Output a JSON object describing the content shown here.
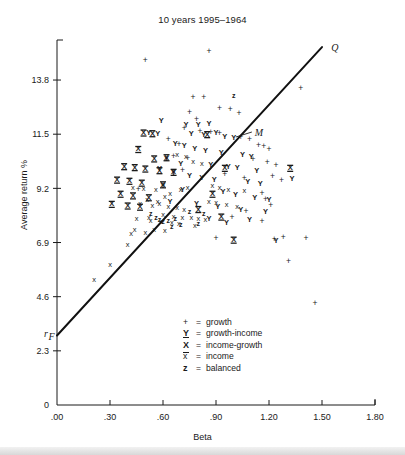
{
  "chart_data": {
    "type": "scatter",
    "title": "10 years 1995–1964",
    "xlabel": "Beta",
    "ylabel": "Average return %",
    "xlim": [
      0.0,
      1.8
    ],
    "ylim": [
      0.0,
      15.5
    ],
    "xticks": [
      0.0,
      0.3,
      0.6,
      0.9,
      1.2,
      1.5,
      1.8
    ],
    "xticklabels": [
      ".00",
      ".30",
      ".60",
      ".90",
      "1.20",
      "1.50",
      "1.80"
    ],
    "yticks": [
      0.0,
      2.3,
      4.6,
      6.9,
      9.2,
      11.5,
      13.8
    ],
    "yticklabels": [
      "0",
      "2.3",
      "4.6",
      "6.9",
      "9.2",
      "11.5",
      "13.8"
    ],
    "grid": false,
    "legend_position": "inside-lower-center",
    "legend": [
      {
        "symbol": "+",
        "label": "growth",
        "key": "growth"
      },
      {
        "symbol": "Y",
        "label": "growth-income",
        "key": "growth-income"
      },
      {
        "symbol": "⫨",
        "label": "income-growth",
        "key": "income-growth"
      },
      {
        "symbol": "x",
        "label": "income",
        "key": "income"
      },
      {
        "symbol": "z",
        "label": "balanced",
        "key": "balanced"
      }
    ],
    "annotations": [
      {
        "text": "Q",
        "x": 1.53,
        "y": 15.15,
        "note": "upper end label of the market line"
      },
      {
        "text": "M",
        "x": 1.12,
        "y": 11.55,
        "note": "market portfolio, leader line to point on line"
      },
      {
        "text": "rF",
        "display": "rₙ",
        "x": -0.055,
        "y": 3.02,
        "note": "risk-free rate intercept on y-axis"
      }
    ],
    "line": {
      "name": "market line",
      "label_start": "r_F",
      "label_end": "Q",
      "x0": 0.0,
      "y0": 2.95,
      "x1": 1.5,
      "y1": 15.2,
      "color": "#111111",
      "width": 2
    },
    "series": [
      {
        "name": "growth",
        "symbol": "+",
        "points": [
          [
            0.5,
            14.6
          ],
          [
            0.86,
            14.98
          ],
          [
            0.77,
            13.05
          ],
          [
            0.83,
            13.05
          ],
          [
            0.92,
            12.6
          ],
          [
            0.98,
            12.55
          ],
          [
            1.03,
            12.35
          ],
          [
            0.75,
            12.4
          ],
          [
            0.79,
            12.1
          ],
          [
            0.72,
            11.75
          ],
          [
            0.81,
            11.62
          ],
          [
            0.87,
            11.55
          ],
          [
            0.92,
            11.5
          ],
          [
            1.04,
            11.35
          ],
          [
            1.09,
            11.25
          ],
          [
            0.63,
            11.28
          ],
          [
            0.69,
            11.05
          ],
          [
            1.14,
            11.0
          ],
          [
            1.17,
            10.95
          ],
          [
            1.2,
            10.85
          ],
          [
            1.38,
            13.45
          ],
          [
            0.66,
            10.55
          ],
          [
            0.74,
            10.45
          ],
          [
            1.11,
            10.42
          ],
          [
            1.19,
            10.28
          ],
          [
            1.24,
            10.15
          ],
          [
            0.71,
            9.95
          ],
          [
            0.95,
            9.78
          ],
          [
            1.06,
            9.6
          ],
          [
            1.22,
            9.7
          ],
          [
            1.27,
            9.52
          ],
          [
            0.46,
            9.15
          ],
          [
            1.16,
            8.95
          ],
          [
            1.18,
            8.72
          ],
          [
            1.21,
            8.48
          ],
          [
            1.07,
            8.2
          ],
          [
            0.99,
            7.95
          ],
          [
            1.16,
            7.8
          ],
          [
            0.9,
            7.05
          ],
          [
            1.23,
            7.0
          ],
          [
            1.28,
            7.12
          ],
          [
            1.41,
            7.05
          ],
          [
            1.46,
            4.3
          ],
          [
            1.31,
            6.1
          ]
        ]
      },
      {
        "name": "growth-income",
        "symbol": "Y",
        "points": [
          [
            0.59,
            12.05
          ],
          [
            0.52,
            11.55
          ],
          [
            0.57,
            11.52
          ],
          [
            0.73,
            11.9
          ],
          [
            0.8,
            11.88
          ],
          [
            0.86,
            11.95
          ],
          [
            0.76,
            11.52
          ],
          [
            0.83,
            11.45
          ],
          [
            0.9,
            11.55
          ],
          [
            0.95,
            11.4
          ],
          [
            1.0,
            11.35
          ],
          [
            0.67,
            11.1
          ],
          [
            0.72,
            10.98
          ],
          [
            0.78,
            10.85
          ],
          [
            0.84,
            10.8
          ],
          [
            0.93,
            10.72
          ],
          [
            1.05,
            10.62
          ],
          [
            1.1,
            10.55
          ],
          [
            0.62,
            10.45
          ],
          [
            0.7,
            10.25
          ],
          [
            0.87,
            10.2
          ],
          [
            0.97,
            10.12
          ],
          [
            1.02,
            10.05
          ],
          [
            1.13,
            9.95
          ],
          [
            0.58,
            10.02
          ],
          [
            0.66,
            9.85
          ],
          [
            0.75,
            9.72
          ],
          [
            0.82,
            9.65
          ],
          [
            0.89,
            9.55
          ],
          [
            1.08,
            9.45
          ],
          [
            1.15,
            9.4
          ],
          [
            1.33,
            9.6
          ],
          [
            0.6,
            9.3
          ],
          [
            0.71,
            9.12
          ],
          [
            0.94,
            9.05
          ],
          [
            1.01,
            8.92
          ],
          [
            1.12,
            8.8
          ],
          [
            1.2,
            8.72
          ],
          [
            0.64,
            8.6
          ],
          [
            0.79,
            8.52
          ],
          [
            0.91,
            8.42
          ],
          [
            1.04,
            8.3
          ],
          [
            1.18,
            8.18
          ],
          [
            1.09,
            7.85
          ],
          [
            1.24,
            6.95
          ],
          [
            0.86,
            7.9
          ],
          [
            0.96,
            7.72
          ]
        ]
      },
      {
        "name": "income-growth",
        "symbol": "⫨",
        "points": [
          [
            0.49,
            11.55
          ],
          [
            0.54,
            11.52
          ],
          [
            0.46,
            10.85
          ],
          [
            0.55,
            10.45
          ],
          [
            0.62,
            10.5
          ],
          [
            0.38,
            10.12
          ],
          [
            0.44,
            10.08
          ],
          [
            0.5,
            10.02
          ],
          [
            0.58,
            9.95
          ],
          [
            0.66,
            9.88
          ],
          [
            0.34,
            9.55
          ],
          [
            0.41,
            9.5
          ],
          [
            0.48,
            9.42
          ],
          [
            0.6,
            9.35
          ],
          [
            0.95,
            10.05
          ],
          [
            1.32,
            10.05
          ],
          [
            0.36,
            8.95
          ],
          [
            0.43,
            8.88
          ],
          [
            0.52,
            8.8
          ],
          [
            0.88,
            8.95
          ],
          [
            0.31,
            8.52
          ],
          [
            0.4,
            8.45
          ],
          [
            0.47,
            8.4
          ],
          [
            0.8,
            8.3
          ],
          [
            0.93,
            7.98
          ],
          [
            1.0,
            7.0
          ],
          [
            0.85,
            11.48
          ]
        ]
      },
      {
        "name": "income",
        "symbol": "x",
        "points": [
          [
            0.21,
            5.3
          ],
          [
            0.3,
            5.95
          ],
          [
            0.4,
            6.8
          ],
          [
            0.44,
            7.45
          ],
          [
            0.52,
            7.95
          ],
          [
            0.58,
            8.55
          ],
          [
            0.61,
            8.82
          ],
          [
            0.64,
            8.95
          ],
          [
            0.7,
            9.15
          ],
          [
            0.74,
            9.22
          ],
          [
            0.56,
            9.12
          ],
          [
            0.49,
            9.18
          ],
          [
            0.43,
            9.22
          ],
          [
            0.51,
            8.7
          ],
          [
            0.57,
            8.62
          ],
          [
            0.47,
            8.55
          ],
          [
            0.54,
            8.45
          ],
          [
            0.63,
            8.4
          ],
          [
            0.68,
            8.35
          ],
          [
            0.72,
            8.28
          ],
          [
            0.6,
            8.05
          ],
          [
            0.66,
            8.0
          ],
          [
            0.71,
            7.95
          ],
          [
            0.76,
            7.92
          ],
          [
            0.8,
            7.88
          ],
          [
            0.84,
            7.84
          ],
          [
            0.45,
            7.9
          ],
          [
            0.53,
            7.82
          ],
          [
            0.59,
            7.78
          ],
          [
            0.65,
            7.74
          ],
          [
            0.69,
            7.7
          ],
          [
            0.78,
            7.62
          ],
          [
            0.86,
            8.62
          ],
          [
            0.9,
            8.58
          ],
          [
            0.96,
            8.48
          ],
          [
            1.02,
            8.42
          ],
          [
            0.88,
            9.3
          ],
          [
            0.92,
            9.22
          ],
          [
            0.97,
            9.15
          ],
          [
            1.06,
            9.08
          ],
          [
            0.77,
            10.3
          ],
          [
            0.82,
            10.25
          ],
          [
            0.73,
            10.55
          ],
          [
            0.68,
            10.62
          ],
          [
            0.55,
            7.42
          ],
          [
            0.61,
            7.38
          ],
          [
            0.5,
            7.3
          ],
          [
            0.42,
            7.25
          ]
        ]
      },
      {
        "name": "balanced",
        "symbol": "z",
        "points": [
          [
            1.0,
            13.1
          ],
          [
            0.53,
            8.1
          ],
          [
            0.56,
            7.95
          ],
          [
            0.58,
            7.85
          ],
          [
            0.6,
            7.75
          ],
          [
            0.63,
            7.82
          ],
          [
            0.67,
            7.88
          ],
          [
            0.75,
            8.18
          ],
          [
            0.83,
            8.12
          ],
          [
            0.8,
            7.68
          ],
          [
            0.7,
            7.62
          ],
          [
            0.65,
            7.55
          ]
        ]
      }
    ]
  },
  "legend_block": {
    "rows": [
      {
        "symbol": "+",
        "eq": "=",
        "label": "growth"
      },
      {
        "symbol": "Y",
        "eq": "=",
        "label": "growth-income"
      },
      {
        "symbol": "X",
        "eq": "=",
        "label": "income-growth"
      },
      {
        "symbol": "x",
        "eq": "=",
        "label": "income"
      },
      {
        "symbol": "z",
        "eq": "=",
        "label": "balanced"
      }
    ]
  }
}
